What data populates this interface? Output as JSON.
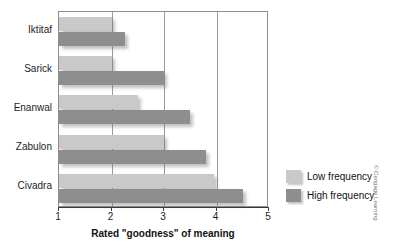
{
  "chart_data": {
    "type": "bar",
    "orientation": "horizontal",
    "title": "",
    "xlabel": "Rated \"goodness\" of meaning",
    "ylabel": "",
    "categories": [
      "Iktitaf",
      "Sarick",
      "Enanwal",
      "Zabulon",
      "Civadra"
    ],
    "xlim": [
      1,
      5
    ],
    "xticks": [
      "1",
      "2",
      "3",
      "4",
      "5"
    ],
    "grid": true,
    "grid_axis": "x",
    "legend_position": "right",
    "series": [
      {
        "name": "Low frequency",
        "color": "#c9c9c9",
        "values": [
          2.0,
          2.0,
          2.5,
          3.0,
          3.95
        ]
      },
      {
        "name": "High frequency",
        "color": "#8e8e8e",
        "values": [
          2.25,
          3.0,
          3.5,
          3.8,
          4.5
        ]
      }
    ]
  },
  "credit": "© Cengage Learning"
}
